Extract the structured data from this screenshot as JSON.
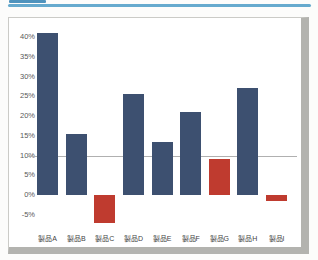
{
  "header": {
    "tab_accent_color": "#4f93bd",
    "rule_color": "#66aace"
  },
  "chart_data": {
    "type": "bar",
    "title": "",
    "xlabel": "",
    "ylabel": "",
    "unit": "%",
    "categories": [
      "製品A",
      "製品B",
      "製品C",
      "製品D",
      "製品E",
      "製品F",
      "製品G",
      "製品H",
      "製品I"
    ],
    "values": [
      41,
      15.5,
      -7,
      25.5,
      13.5,
      21,
      9,
      27,
      -1.5
    ],
    "bar_colors": [
      "#3d5070",
      "#3d5070",
      "#bf3b2f",
      "#3d5070",
      "#3d5070",
      "#3d5070",
      "#bf3b2f",
      "#3d5070",
      "#bf3b2f"
    ],
    "color_legend": {
      "blue": "#3d5070",
      "red": "#bf3b2f",
      "red_means": "below 10% reference line"
    },
    "y_ticks": [
      "40%",
      "35%",
      "30%",
      "25%",
      "20%",
      "15%",
      "10%",
      "5%",
      "0%",
      "-5%"
    ],
    "y_tick_values": [
      40,
      35,
      30,
      25,
      20,
      15,
      10,
      5,
      0,
      -5
    ],
    "ylim": [
      -8.5,
      43
    ],
    "reference_line": {
      "value": 10,
      "color": "#b0b0b0"
    },
    "gridlines": false,
    "legend": false,
    "plot_background": "#ffffff"
  }
}
